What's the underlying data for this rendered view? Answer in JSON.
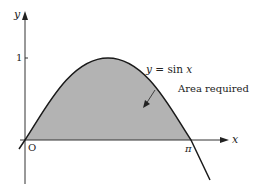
{
  "diagram": {
    "type": "area-under-curve",
    "function": "y = sin x",
    "axes": {
      "x_label": "x",
      "y_label": "y",
      "origin_label": "O",
      "x_ticks": [
        "π"
      ],
      "y_ticks": [
        "1"
      ]
    },
    "labels": {
      "curve": "y = sin x",
      "curve_prefix": "y",
      "curve_eq": " = sin ",
      "curve_var": "x",
      "area": "Area required"
    },
    "colors": {
      "fill": "#b3b3b3",
      "line": "#1a1a1a",
      "background": "#ffffff"
    },
    "shaded_region": {
      "from": "0",
      "to": "π"
    }
  }
}
